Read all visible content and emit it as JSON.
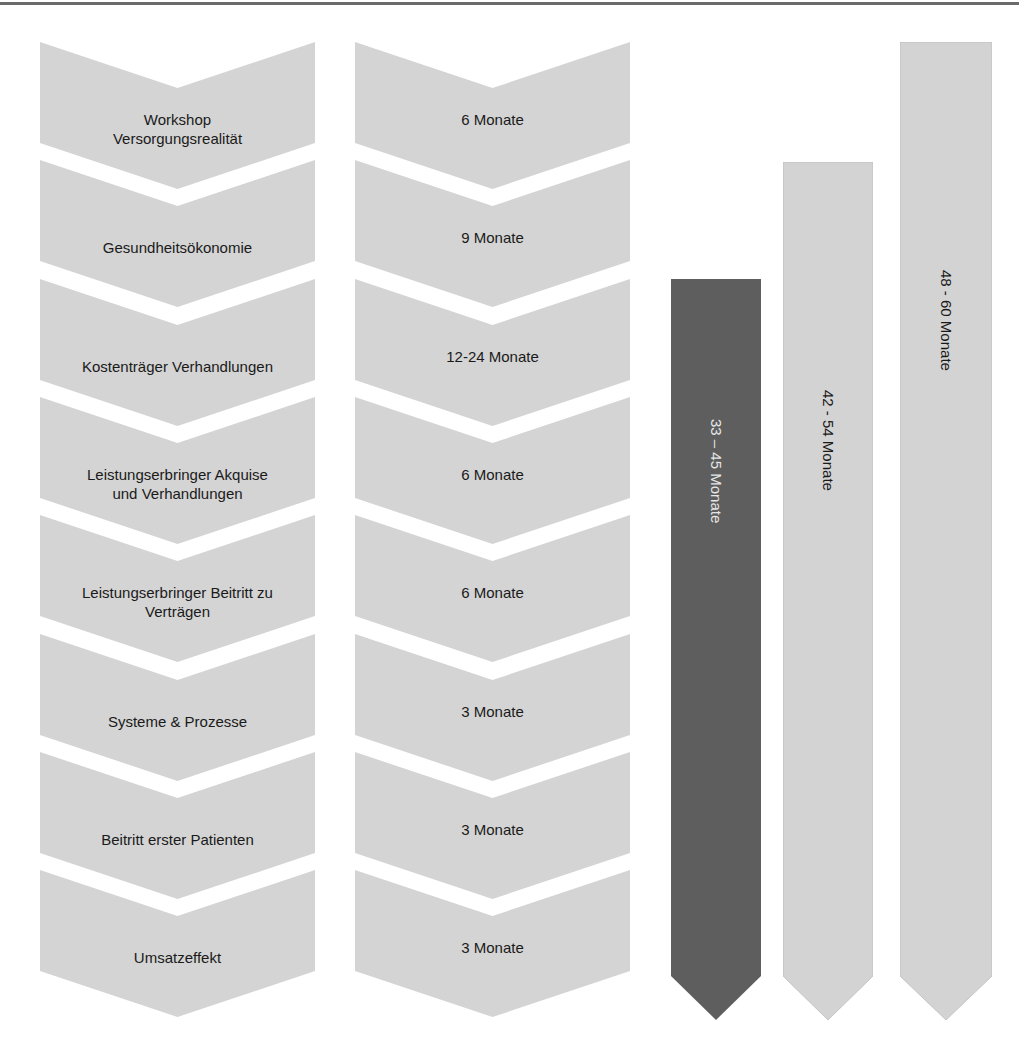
{
  "diagram": {
    "phases": [
      {
        "label": "Workshop\nVersorgungsrealität",
        "line1": "Workshop",
        "line2": "Versorgungsrealität",
        "duration": "6 Monate"
      },
      {
        "label": "Gesundheitsökonomie",
        "line1": "Gesundheitsökonomie",
        "line2": "",
        "duration": "9 Monate"
      },
      {
        "label": "Kostenträger Verhandlungen",
        "line1": "Kostenträger Verhandlungen",
        "line2": "",
        "duration": "12-24 Monate"
      },
      {
        "label": "Leistungserbringer Akquise und Verhandlungen",
        "line1": "Leistungserbringer Akquise",
        "line2": "und Verhandlungen",
        "duration": "6 Monate"
      },
      {
        "label": "Leistungserbringer Beitritt zu Verträgen",
        "line1": "Leistungserbringer Beitritt zu",
        "line2": "Verträgen",
        "duration": "6 Monate"
      },
      {
        "label": "Systeme & Prozesse",
        "line1": "Systeme & Prozesse",
        "line2": "",
        "duration": "3 Monate"
      },
      {
        "label": "Beitritt erster Patienten",
        "line1": "Beitritt erster Patienten",
        "line2": "",
        "duration": "3 Monate"
      },
      {
        "label": "Umsatzeffekt",
        "line1": "Umsatzeffekt",
        "line2": "",
        "duration": "3 Monate"
      }
    ],
    "totals": [
      {
        "label": "33 – 45  Monate",
        "color": "#5e5e5e",
        "text_color": "#e6e6e6"
      },
      {
        "label": "42 - 54 Monate",
        "color": "#d3d3d3",
        "text_color": "#1a1a1a"
      },
      {
        "label": "48 - 60 Monate",
        "color": "#d3d3d3",
        "text_color": "#1a1a1a"
      }
    ],
    "colors": {
      "chevron_fill": "#d4d4d4",
      "dark_arrow": "#5e5e5e",
      "light_arrow": "#d3d3d3"
    }
  }
}
